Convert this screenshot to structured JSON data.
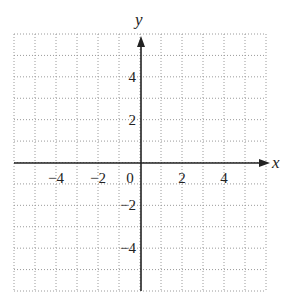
{
  "chart_data": {
    "type": "scatter",
    "title": "",
    "xlabel": "x",
    "ylabel": "y",
    "xlim": [
      -6,
      6
    ],
    "ylim": [
      -6,
      6
    ],
    "grid": true,
    "grid_style": "dotted",
    "grid_step": 1,
    "x_ticks": [
      -4,
      -2,
      0,
      2,
      4
    ],
    "x_tick_labels": [
      "−4",
      "−2",
      "0",
      "2",
      "4"
    ],
    "y_ticks": [
      4,
      2,
      -2,
      -4
    ],
    "y_tick_labels": [
      "4",
      "2",
      "−2",
      "−4"
    ],
    "series": []
  },
  "colors": {
    "axis": "#222222",
    "grid": "#9a9a9a",
    "background": "#ffffff"
  }
}
